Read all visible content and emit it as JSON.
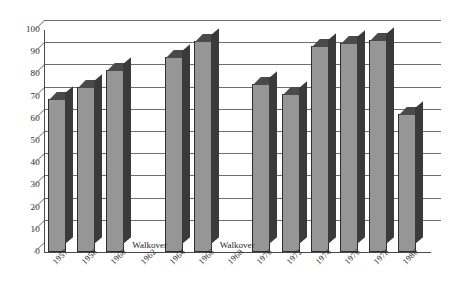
{
  "chart_data": {
    "type": "bar",
    "title": "",
    "subtitle": "",
    "xlabel": "",
    "ylabel": "",
    "ylim": [
      0,
      100
    ],
    "ytick_step": 10,
    "yticks": [
      "100",
      "90",
      "80",
      "70",
      "60",
      "50",
      "40",
      "30",
      "20",
      "10",
      "0"
    ],
    "grid": true,
    "legend": "none",
    "style": "3d-column",
    "categories": [
      "1957",
      "1958",
      "1960",
      "1962",
      "1964",
      "1966",
      "1968",
      "1970",
      "1972",
      "1974",
      "1976",
      "1978",
      "1980"
    ],
    "values": [
      69,
      74.5,
      82,
      null,
      88,
      95,
      null,
      75.5,
      71,
      93,
      94,
      95.5,
      62
    ],
    "annotations": [
      {
        "category": "1962",
        "text": "Walkover"
      },
      {
        "category": "1968",
        "text": "Walkover"
      }
    ],
    "colors": {
      "bar_face": "#969696",
      "bar_side": "#3a3a3a",
      "bar_top": "#4a4a4a",
      "bar_outline": "#2f2f2f",
      "gridline": "#6e6e6e",
      "axis": "#4a4a4a",
      "text": "#2b2b2b",
      "background": "#ffffff"
    }
  }
}
